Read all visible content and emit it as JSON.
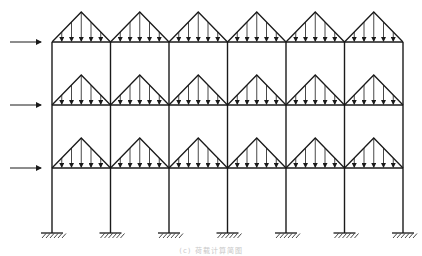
{
  "figure": {
    "caption": "(c) 荷载计算简图"
  },
  "frame": {
    "bays": 6,
    "storeys": 3,
    "column_x": [
      52,
      110.5,
      169,
      227.5,
      286,
      344.5,
      403
    ],
    "beam_y": [
      42,
      105,
      168
    ],
    "base_y": 233,
    "triangle_height": 30,
    "arrows_per_triangle": 5,
    "support_type": "fixed",
    "line_color": "#1a1a1a"
  },
  "loads": {
    "horizontal": [
      {
        "level": 1,
        "y": 42,
        "x_start": 10,
        "x_end": 42
      },
      {
        "level": 2,
        "y": 105,
        "x_start": 10,
        "x_end": 42
      },
      {
        "level": 3,
        "y": 168,
        "x_start": 10,
        "x_end": 42
      }
    ],
    "distributed": "triangular"
  }
}
